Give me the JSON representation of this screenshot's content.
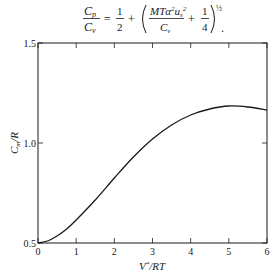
{
  "formula": {
    "lhs_num": "C",
    "lhs_num_sub": "p",
    "lhs_den": "C",
    "lhs_den_sub": "v",
    "equals": "=",
    "half_num": "1",
    "half_den": "2",
    "plus": "+",
    "inner_num": "MTα",
    "inner_num_sup": "2",
    "inner_num_u": "u",
    "inner_num_u_sub": "s",
    "inner_num_u_sup": "2",
    "inner_den": "C",
    "inner_den_sub": "v",
    "plus2": "+",
    "quarter_num": "1",
    "quarter_den": "4",
    "exponent": "½",
    "period": "."
  },
  "chart_data": {
    "type": "line",
    "title": "",
    "xlabel": "V*/RT",
    "ylabel": "C_m/R",
    "xlim": [
      0,
      6
    ],
    "ylim": [
      0.5,
      1.5
    ],
    "x_ticks": [
      0,
      1,
      2,
      3,
      4,
      5,
      6
    ],
    "x_tick_labels": [
      "0",
      "1",
      "2",
      "3",
      "4",
      "5",
      "6"
    ],
    "y_ticks": [
      0.5,
      1.0,
      1.5
    ],
    "y_tick_labels": [
      "0.5",
      "1.0",
      "1.5"
    ],
    "grid": false,
    "legend": null,
    "series": [
      {
        "name": "C_m/R",
        "x": [
          0,
          0.25,
          0.5,
          0.75,
          1.0,
          1.5,
          2.0,
          2.5,
          3.0,
          3.5,
          4.0,
          4.5,
          5.0,
          5.5,
          6.0
        ],
        "values": [
          0.5,
          0.51,
          0.535,
          0.57,
          0.615,
          0.715,
          0.825,
          0.93,
          1.02,
          1.09,
          1.14,
          1.17,
          1.185,
          1.18,
          1.165
        ]
      }
    ]
  }
}
